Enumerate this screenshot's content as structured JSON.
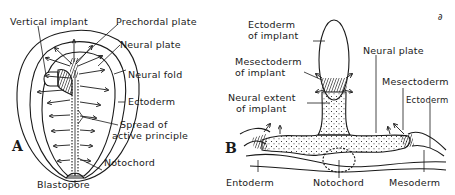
{
  "figure": {
    "panel_a": {
      "letter": "A",
      "labels": {
        "vertical_implant": "Vertical implant",
        "prechordal_plate": "Prechordal plate",
        "neural_plate": "Neural plate",
        "neural_fold": "Neural fold",
        "ectoderm": "Ectoderm",
        "spread_1": "Spread  of",
        "spread_2": "active principle",
        "notochord": "Notochord",
        "blastopore": "Blastopore"
      }
    },
    "panel_b": {
      "letter": "B",
      "labels": {
        "ectoderm_implant_1": "Ectoderm",
        "ectoderm_implant_2": "of implant",
        "neural_plate": "Neural plate",
        "mesectoderm_implant_1": "Mesectoderm",
        "mesectoderm_implant_2": "of implant",
        "mesectoderm": "Mesectoderm",
        "neural_extent_1": "Neural extent",
        "neural_extent_2": "of implant",
        "ectoderm": "Ectoderm",
        "entoderm": "Entoderm",
        "notochord": "Notochord",
        "mesoderm": "Mesoderm"
      }
    },
    "corner_mark": "∂"
  },
  "colors": {
    "ink": "#1a1a1a",
    "background": "#ffffff"
  }
}
